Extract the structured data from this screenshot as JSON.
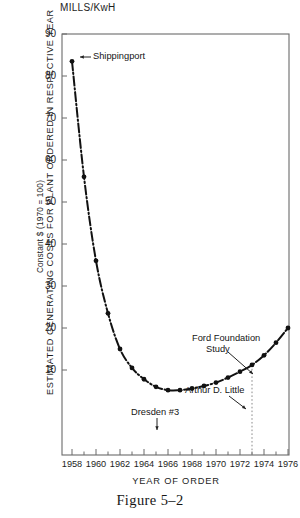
{
  "figure": {
    "caption": "Figure 5–2",
    "unit_label": "MILLS/KwH",
    "ylabel_main": "ESTIMATED GENERATING COSTS FOR PLANT ORDERED IN RESPECTIVE YEAR",
    "ylabel_sub": "Constant $ (1970 = 100)",
    "xlabel": "YEAR OF ORDER"
  },
  "chart_data": {
    "type": "line",
    "title": "",
    "xlabel": "YEAR OF ORDER",
    "ylabel": "ESTIMATED GENERATING COSTS FOR PLANT ORDERED IN RESPECTIVE YEAR",
    "ylabel_secondary": "Constant $ (1970 = 100)",
    "yunits": "MILLS/KwH",
    "xlim": [
      1957,
      1977
    ],
    "ylim": [
      0,
      90
    ],
    "grid": false,
    "legend": null,
    "ytick_labels": [
      90,
      80,
      70,
      60,
      50,
      40,
      30,
      20,
      10
    ],
    "xtick_labels": [
      1958,
      1960,
      1962,
      1964,
      1966,
      1968,
      1970,
      1972,
      1974,
      1976
    ],
    "line_style": "dash-dot",
    "marker": "filled-circle",
    "x": [
      1958,
      1959,
      1960,
      1961,
      1962,
      1963,
      1964,
      1965,
      1966,
      1967,
      1968,
      1969,
      1970,
      1971,
      1972,
      1973,
      1974,
      1975,
      1976
    ],
    "values": [
      83.5,
      56.0,
      36.0,
      23.5,
      15.0,
      10.5,
      7.8,
      6.0,
      5.2,
      5.2,
      5.6,
      6.2,
      7.0,
      8.2,
      9.6,
      11.2,
      13.5,
      16.5,
      20.0
    ],
    "annotations": [
      {
        "label": "Shippingport",
        "x": 1958,
        "y": 83.5
      },
      {
        "label": "Dresden #3",
        "x": 1966,
        "y": 5.2
      },
      {
        "label": "Arthur D. Little",
        "x": 1973,
        "y": 11.2
      },
      {
        "label": "Ford Foundation Study",
        "x": 1975,
        "y": 16.5
      }
    ],
    "reference_lines": [
      {
        "type": "vertical-dotted",
        "x": 1973,
        "from_y": 0,
        "to_y": 11.2
      }
    ]
  },
  "annotations": {
    "shippingport": "Shippingport",
    "dresden": "Dresden #3",
    "adl": "Arthur D. Little",
    "ford_line1": "Ford Foundation",
    "ford_line2": "Study"
  }
}
